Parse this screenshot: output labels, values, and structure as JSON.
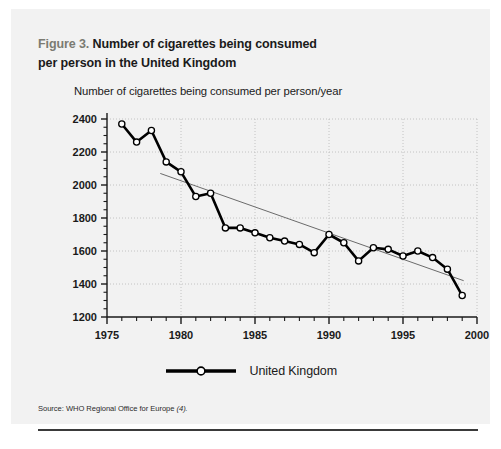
{
  "figure": {
    "number_label": "Figure 3.",
    "title_line1": "Number of cigarettes being consumed",
    "title_line2": "per person in the United Kingdom",
    "source_prefix": "Source:",
    "source_text": "WHO Regional Office for Europe",
    "source_ref": "(4)."
  },
  "legend": {
    "series_label": "United Kingdom"
  },
  "colors": {
    "panel_background": "#f2f2f2",
    "page_background": "#ffffff",
    "figure_number": "#7b7b72",
    "title_text": "#1a1a1a",
    "series_line": "#000000",
    "marker_fill": "#ffffff",
    "trend_line": "#6b6b6b",
    "grid": "#bdbdbd",
    "axis": "#1a1a1a",
    "rule": "#3a3a3a"
  },
  "chart_data": {
    "type": "line",
    "title": "Number of cigarettes being consumed per person in the United Kingdom",
    "subtitle": "Number of cigarettes being consumed per person/year",
    "xlabel": "",
    "ylabel": "Number of cigarettes being consumed per person/year",
    "xlim": [
      1975,
      2000
    ],
    "ylim": [
      1200,
      2400
    ],
    "xticks": [
      1975,
      1980,
      1985,
      1990,
      1995,
      2000
    ],
    "xtick_labels": [
      "1975",
      "1980",
      "1985",
      "1990",
      "1995",
      "2000"
    ],
    "yticks": [
      1200,
      1400,
      1600,
      1800,
      2000,
      2200,
      2400
    ],
    "ytick_labels": [
      "1200",
      "1400",
      "1600",
      "1800",
      "2000",
      "2200",
      "2400"
    ],
    "minor_ticks": true,
    "grid": true,
    "grid_style": "dotted",
    "legend_position": "bottom",
    "marker": "circle-open",
    "series": [
      {
        "name": "United Kingdom",
        "x": [
          1976,
          1977,
          1978,
          1979,
          1980,
          1981,
          1982,
          1983,
          1984,
          1985,
          1986,
          1987,
          1988,
          1989,
          1990,
          1991,
          1992,
          1993,
          1994,
          1995,
          1996,
          1997,
          1998,
          1999
        ],
        "values": [
          2370,
          2260,
          2330,
          2140,
          2080,
          1930,
          1950,
          1740,
          1740,
          1710,
          1680,
          1660,
          1640,
          1590,
          1700,
          1650,
          1540,
          1620,
          1610,
          1570,
          1600,
          1560,
          1490,
          1330
        ]
      }
    ],
    "trend_line": {
      "name": "linear trend",
      "x": [
        1978.6,
        1999.1
      ],
      "values": [
        2070,
        1420
      ]
    }
  }
}
